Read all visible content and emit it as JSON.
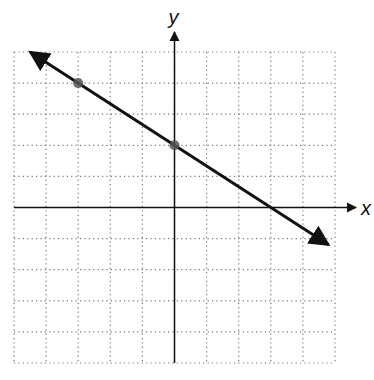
{
  "chart_data": {
    "type": "line",
    "title": "",
    "xlabel": "x",
    "ylabel": "y",
    "xlim": [
      -5,
      5
    ],
    "ylim": [
      -5,
      5
    ],
    "grid": true,
    "grid_style": "dotted",
    "tick_labels": false,
    "points": [
      {
        "x": -3,
        "y": 4
      },
      {
        "x": 0,
        "y": 2
      }
    ],
    "line": {
      "slope": -0.6667,
      "intercept": 2,
      "equation": "y = -2/3 x + 2",
      "x_intercept": 3,
      "arrows": "both",
      "start": {
        "x": -4.5,
        "y": 5
      },
      "end": {
        "x": 4.8,
        "y": -1.2
      }
    }
  },
  "labels": {
    "x": "x",
    "y": "y"
  },
  "colors": {
    "line": "#111111",
    "point": "#555555",
    "grid": "#777777",
    "axis": "#111111"
  }
}
